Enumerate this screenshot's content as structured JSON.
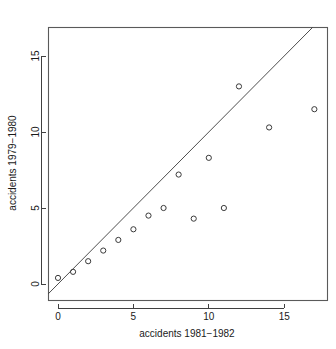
{
  "chart_data": {
    "type": "scatter",
    "title": "",
    "xlabel": "accidents 1981−1982",
    "ylabel": "accidents 1979−1980",
    "xlim": [
      -0.65,
      17.8
    ],
    "ylim": [
      -0.7,
      17.6
    ],
    "xticks": [
      0,
      5,
      10,
      15
    ],
    "xticklabels": [
      "0",
      "5",
      "10",
      "15"
    ],
    "yticks": [
      0,
      5,
      10,
      15
    ],
    "yticklabels": [
      "0",
      "5",
      "10",
      "15"
    ],
    "grid": false,
    "legend": null,
    "marker": "open-circle",
    "marker_color": "#3a3a3a",
    "points": [
      {
        "x": 0,
        "y": 0.4
      },
      {
        "x": 1,
        "y": 0.8
      },
      {
        "x": 2,
        "y": 1.5
      },
      {
        "x": 3,
        "y": 2.2
      },
      {
        "x": 4,
        "y": 2.9
      },
      {
        "x": 5,
        "y": 3.6
      },
      {
        "x": 6,
        "y": 4.5
      },
      {
        "x": 7,
        "y": 5.0
      },
      {
        "x": 8,
        "y": 7.2
      },
      {
        "x": 9,
        "y": 4.3
      },
      {
        "x": 10,
        "y": 8.3
      },
      {
        "x": 11,
        "y": 5.0
      },
      {
        "x": 12,
        "y": 13.0
      },
      {
        "x": 14,
        "y": 10.3
      },
      {
        "x": 17,
        "y": 11.5
      }
    ],
    "annotations": [
      {
        "type": "line",
        "name": "identity-line",
        "description": "y = x reference line",
        "x0": -0.65,
        "y0": -0.65,
        "x1": 17.6,
        "y1": 17.6,
        "color": "#3a3a3a"
      }
    ]
  },
  "axes": {
    "x_title": "accidents 1981−1982",
    "y_title": "accidents 1979−1980"
  }
}
